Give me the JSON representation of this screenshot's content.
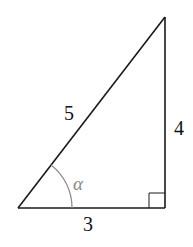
{
  "diagram": {
    "type": "right-triangle",
    "colors": {
      "stroke": "#1a1a1a",
      "angle_arc": "#8a8a8a",
      "background": "#ffffff"
    },
    "vertices": {
      "bottom_left": [
        18,
        208
      ],
      "bottom_right": [
        165,
        208
      ],
      "top": [
        165,
        17
      ]
    },
    "sides": {
      "hypotenuse": {
        "label": "5"
      },
      "vertical": {
        "label": "4"
      },
      "base": {
        "label": "3"
      }
    },
    "angle": {
      "label": "α",
      "vertex": "bottom_left"
    },
    "right_angle_marker": {
      "vertex": "bottom_right"
    }
  }
}
